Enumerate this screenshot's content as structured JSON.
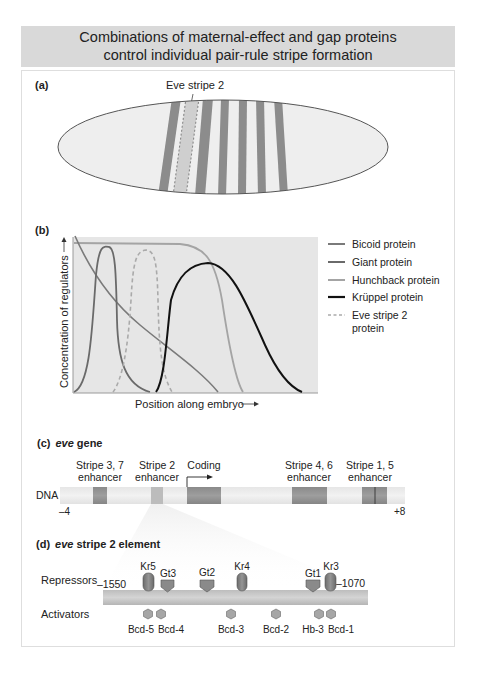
{
  "title": {
    "line1": "Combinations of maternal-effect and gap proteins",
    "line2": "control individual pair-rule stripe formation"
  },
  "panel_a": {
    "label": "(a)",
    "callout": "Eve stripe 2",
    "embryo_stripes": 7
  },
  "panel_b": {
    "label": "(b)",
    "ylabel": "Concentration of regulators",
    "xlabel": "Position along embryo",
    "legend": [
      {
        "name": "Bicoid protein",
        "color": "#7a7a7a",
        "style": "solid"
      },
      {
        "name": "Giant protein",
        "color": "#6a6a6a",
        "style": "solid"
      },
      {
        "name": "Hunchback protein",
        "color": "#a4a4a4",
        "style": "solid"
      },
      {
        "name": "Krüppel protein",
        "color": "#111111",
        "style": "solid"
      },
      {
        "name": "Eve stripe 2",
        "name_line2": "protein",
        "color": "#aaaaaa",
        "style": "dashed"
      }
    ]
  },
  "panel_c": {
    "label": "(c)",
    "gene_name": "eve",
    "gene_suffix": "gene",
    "dna_label": "DNA",
    "left_coord": "–4",
    "right_coord": "+8",
    "regions": [
      {
        "line1": "Stripe 3, 7",
        "line2": "enhancer"
      },
      {
        "line1": "Stripe 2",
        "line2": "enhancer"
      },
      {
        "line1": "Coding",
        "line2": ""
      },
      {
        "line1": "Stripe 4, 6",
        "line2": "enhancer"
      },
      {
        "line1": "Stripe 1, 5",
        "line2": "enhancer"
      }
    ]
  },
  "panel_d": {
    "label": "(d)",
    "gene_name": "eve",
    "title_suffix": "stripe 2 element",
    "repressors_label": "Repressors",
    "activators_label": "Activators",
    "left_coord": "–1550",
    "right_coord": "–1070",
    "repressors": [
      "Kr5",
      "Gt3",
      "Gt2",
      "Kr4",
      "Gt1",
      "Kr3"
    ],
    "activators": [
      "Bcd-5",
      "Bcd-4",
      "Bcd-3",
      "Bcd-2",
      "Hb-3",
      "Bcd-1"
    ]
  }
}
